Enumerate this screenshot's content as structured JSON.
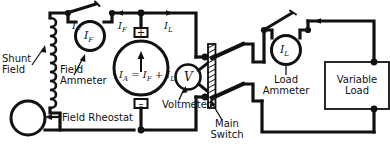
{
  "diagram": {
    "type": "electrical-schematic",
    "line_color": "#111111",
    "background_color": "#ffffff",
    "labels": {
      "shunt_field": "Shunt\nField",
      "field_ammeter": "Field\nAmmeter",
      "field_rheostat": "Field Rheostat",
      "voltmeter": "Voltmeter",
      "main_switch": "Main\nSwitch",
      "load_ammeter": "Load\nAmmeter",
      "variable_load": "Variable\nLoad"
    },
    "symbols": {
      "field_ammeter_meter": "I",
      "field_ammeter_meter_sub": "F",
      "load_ammeter_meter": "I",
      "load_ammeter_meter_sub": "L",
      "voltmeter_meter": "V",
      "current_field_1": "I",
      "current_field_1_sub": "F",
      "current_field_2": "I",
      "current_field_2_sub": "F",
      "current_load": "I",
      "current_load_sub": "L",
      "armature_equation": "I",
      "armature_equation_sub1": "A",
      "armature_equation_mid": " = I",
      "armature_equation_sub2": "F",
      "armature_equation_plus": " + I",
      "armature_equation_sub3": "L",
      "terminal_positive": "+",
      "terminal_negative": "–"
    },
    "components": [
      {
        "name": "shunt-field-coil",
        "kind": "coil",
        "turns": 9
      },
      {
        "name": "field-ammeter",
        "kind": "ammeter"
      },
      {
        "name": "field-ammeter-shorting-switch",
        "kind": "knife-switch",
        "state": "open"
      },
      {
        "name": "generator-armature",
        "kind": "dc-machine"
      },
      {
        "name": "field-rheostat",
        "kind": "rheostat-tap"
      },
      {
        "name": "voltmeter",
        "kind": "voltmeter"
      },
      {
        "name": "main-switch",
        "kind": "double-pole-knife-switch",
        "state": "open"
      },
      {
        "name": "load-ammeter",
        "kind": "ammeter"
      },
      {
        "name": "load-ammeter-shorting-switch",
        "kind": "knife-switch",
        "state": "open"
      },
      {
        "name": "variable-load",
        "kind": "resistor-box"
      }
    ]
  }
}
